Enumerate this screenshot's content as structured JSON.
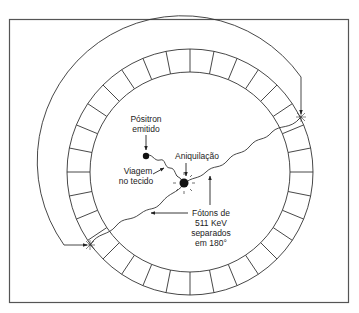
{
  "diagram": {
    "labels": {
      "positron_line1": "Pósitron",
      "positron_line2": "emitido",
      "annihilation": "Aniquilação",
      "travel_line1": "Viagem",
      "travel_line2": "no tecido",
      "photons_line1": "Fótons de",
      "photons_line2": "511 KeV",
      "photons_line3": "separados",
      "photons_line4": "em 180°"
    },
    "colors": {
      "stroke": "#333333",
      "background": "#ffffff",
      "frame": "#555555"
    },
    "detector_ring": {
      "center": [
        190,
        172
      ],
      "outer_radius": 123,
      "inner_radius": 100,
      "segments": 32
    }
  }
}
